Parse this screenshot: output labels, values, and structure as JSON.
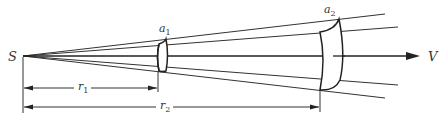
{
  "diagram": {
    "source_label": "S",
    "axis_end_label": "V",
    "surface_1": {
      "label": "a",
      "subscript": "1"
    },
    "surface_2": {
      "label": "a",
      "subscript": "2"
    },
    "dimension_1": {
      "label": "r",
      "subscript": "1"
    },
    "dimension_2": {
      "label": "r",
      "subscript": "2"
    },
    "colors": {
      "line": "#222222",
      "background": "#ffffff",
      "text": "#333333"
    }
  }
}
